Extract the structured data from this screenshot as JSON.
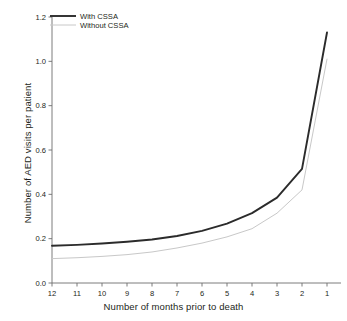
{
  "chart_data": {
    "type": "line",
    "title": "",
    "xlabel": "Number of months prior to death",
    "ylabel": "Number of AED visits per patient",
    "categories": [
      12,
      11,
      10,
      9,
      8,
      7,
      6,
      5,
      4,
      3,
      2,
      1
    ],
    "x_tick_labels": [
      "12",
      "11",
      "10",
      "9",
      "8",
      "7",
      "6",
      "5",
      "4",
      "3",
      "2",
      "1"
    ],
    "y_tick_labels": [
      "0.0",
      "0.2",
      "0.4",
      "0.6",
      "0.8",
      "1.0",
      "1.2"
    ],
    "y_tick_values": [
      0.0,
      0.2,
      0.4,
      0.6,
      0.8,
      1.0,
      1.2
    ],
    "ylim": [
      0.0,
      1.2
    ],
    "xlim_reversed": true,
    "grid": false,
    "legend_position": "top-left",
    "series": [
      {
        "name": "With CSSA",
        "color": "#2b2b2b",
        "width": 1.9,
        "values": [
          0.168,
          0.172,
          0.178,
          0.186,
          0.196,
          0.212,
          0.235,
          0.268,
          0.315,
          0.385,
          0.515,
          1.13
        ]
      },
      {
        "name": "Without CSSA",
        "color": "#c8c8c8",
        "width": 1.0,
        "values": [
          0.11,
          0.114,
          0.12,
          0.128,
          0.14,
          0.158,
          0.18,
          0.208,
          0.245,
          0.315,
          0.42,
          1.01
        ]
      }
    ]
  },
  "legend": {
    "items": [
      {
        "label": "With CSSA"
      },
      {
        "label": "Without CSSA"
      }
    ]
  },
  "axes": {
    "x_title": "Number of months prior to death",
    "y_title": "Number of AED visits per patient"
  },
  "colors": {
    "background": "#ffffff",
    "axis": "#6e6e6e",
    "text": "#231f20",
    "series_with": "#2b2b2b",
    "series_without": "#c8c8c8"
  }
}
